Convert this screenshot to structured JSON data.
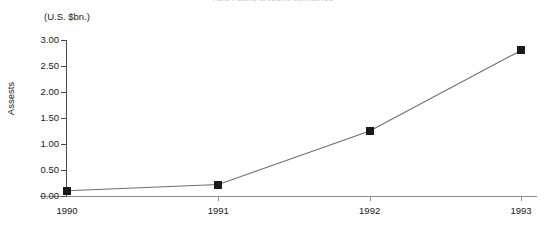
{
  "chart_data": {
    "type": "line",
    "title": "",
    "title_remnant": "Asia-Pacific property derivatives",
    "unit_caption": "(U.S. $bn.)",
    "xlabel": "",
    "ylabel": "Assests",
    "categories": [
      "1990",
      "1991",
      "1992",
      "1993"
    ],
    "x": [
      1990,
      1991,
      1992,
      1993
    ],
    "values": [
      0.1,
      0.22,
      1.25,
      2.8
    ],
    "series": [
      {
        "name": "Assests",
        "values": [
          0.1,
          0.22,
          1.25,
          2.8
        ]
      }
    ],
    "ylim": [
      0.0,
      3.0
    ],
    "ytick_values": [
      3.0,
      2.5,
      2.0,
      1.5,
      1.0,
      0.5,
      0.0
    ],
    "ytick_labels": [
      "3.00",
      "2.50",
      "2.00",
      "1.50",
      "1.00",
      "0.50",
      "0.00"
    ],
    "xtick_labels": [
      "1990",
      "1991",
      "1992",
      "1993"
    ],
    "grid": false,
    "legend": null,
    "legend_position": "none",
    "marker_style": "square",
    "marker_color": "#1a1a1a",
    "line_color": "#6e6e6e",
    "background_color": "#ffffff",
    "axis_color": "#4a4a4a"
  }
}
